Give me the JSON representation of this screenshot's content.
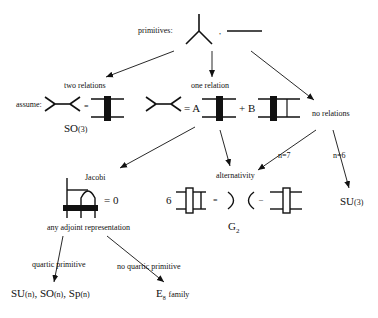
{
  "diagram": {
    "primitives_label": "primitives:",
    "primitives_separator": ",",
    "branches": {
      "two_relations": {
        "label": "two relations",
        "assume_label": "assume:",
        "equals": "=",
        "result_main": "SO",
        "result_sup": "(3)"
      },
      "one_relation": {
        "label": "one relation",
        "eq_A": "= A",
        "plus_B": "+ B"
      },
      "no_relations": {
        "label": "no relations",
        "n7": "n=7",
        "n6": "n=6",
        "result_main": "SU",
        "result_sup": "(3)"
      }
    },
    "jacobi": {
      "label": "Jacobi",
      "equals_zero": "= 0",
      "sublabel": "any adjoint representation"
    },
    "alternativity": {
      "label": "alternativity",
      "coef": "6",
      "equals": "=",
      "minus": "–",
      "result_main": "G",
      "result_sub": "2"
    },
    "leaves": {
      "quartic": {
        "label": "quartic primitive",
        "r1": "SU",
        "r1s": "(n)",
        "sep1": ",",
        "r2": "SO",
        "r2s": "(n)",
        "sep2": ",",
        "r3": "Sp",
        "r3s": "(n)"
      },
      "no_quartic": {
        "label": "no quartic primitive",
        "main": "E",
        "sub": "8",
        "family": "family"
      }
    }
  }
}
